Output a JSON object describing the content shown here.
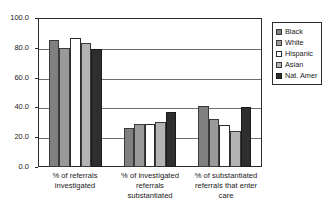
{
  "chart_data": {
    "type": "bar",
    "title": "",
    "xlabel": "",
    "ylabel": "",
    "ylim": [
      0.0,
      100.0
    ],
    "yticks": [
      "0.0",
      "20.0",
      "40.0",
      "60.0",
      "80.0",
      "100.0"
    ],
    "grid": true,
    "legend_position": "right",
    "categories": [
      "% of referrals investigated",
      "% of investigated referrals substantiated",
      "% of substantiated referrals that enter care"
    ],
    "category_lines": [
      [
        "% of referrals",
        "investigated"
      ],
      [
        "% of investigated",
        "referrals",
        "substantiated"
      ],
      [
        "% of substantiated",
        "referrals that enter",
        "care"
      ]
    ],
    "series": [
      {
        "name": "Black",
        "color": "#808080",
        "values": [
          85.0,
          26.5,
          41.0
        ]
      },
      {
        "name": "White",
        "color": "#9a9a9a",
        "values": [
          80.0,
          29.0,
          32.0
        ]
      },
      {
        "name": "Hispanic",
        "color": "#ffffff",
        "values": [
          86.5,
          29.0,
          28.5
        ]
      },
      {
        "name": "Asian",
        "color": "#b3b3b3",
        "values": [
          83.5,
          30.0,
          24.5
        ]
      },
      {
        "name": "Nat. Amer",
        "color": "#2e2e2e",
        "values": [
          79.0,
          37.0,
          40.5
        ]
      }
    ]
  },
  "legend": {
    "items": [
      {
        "label": "Black"
      },
      {
        "label": "White"
      },
      {
        "label": "Hispanic"
      },
      {
        "label": "Asian"
      },
      {
        "label": "Nat. Amer"
      }
    ]
  }
}
